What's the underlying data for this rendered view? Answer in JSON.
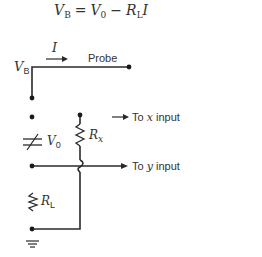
{
  "equation": {
    "lhs_main": "V",
    "lhs_sub": "B",
    "equals": "=",
    "v0_main": "V",
    "v0_sub": "0",
    "minus": "−",
    "rl_main": "R",
    "rl_sub": "L",
    "current": "I"
  },
  "labels": {
    "current_main": "I",
    "vb_main": "V",
    "vb_sub": "B",
    "probe": "Probe",
    "v0_main": "V",
    "v0_sub": "0",
    "rx_main": "R",
    "rx_sub": "x",
    "rl_main": "R",
    "rl_sub": "L",
    "to_x_prefix": "To ",
    "to_x_var": "x",
    "to_x_suffix": " input",
    "to_y_prefix": "To ",
    "to_y_var": "y",
    "to_y_suffix": " input"
  },
  "colors": {
    "line": "#2a2a2a",
    "text": "#333333",
    "background": "#ffffff"
  }
}
